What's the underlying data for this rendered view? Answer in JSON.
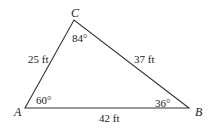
{
  "diagram": {
    "type": "triangle",
    "vertices": {
      "A": {
        "label": "A",
        "x": 25,
        "y": 108
      },
      "B": {
        "label": "B",
        "x": 189,
        "y": 108
      },
      "C": {
        "label": "C",
        "x": 74,
        "y": 20
      }
    },
    "sides": {
      "AC": {
        "label": "25 ft"
      },
      "CB": {
        "label": "37 ft"
      },
      "AB": {
        "label": "42 ft"
      }
    },
    "angles": {
      "A": {
        "label": "60°"
      },
      "B": {
        "label": "36°"
      },
      "C": {
        "label": "84°"
      }
    },
    "line_color": "#333333",
    "text_color": "#222222"
  }
}
